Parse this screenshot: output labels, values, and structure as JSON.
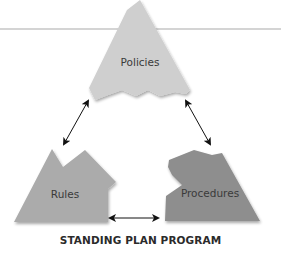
{
  "diagram": {
    "title": "STANDING PLAN PROGRAM",
    "nodes": [
      {
        "id": "policies",
        "label": "Policies",
        "color": "#cfcfcf"
      },
      {
        "id": "rules",
        "label": "Rules",
        "color": "#ababab"
      },
      {
        "id": "procedures",
        "label": "Procedures",
        "color": "#8e8e8e"
      }
    ],
    "edges": [
      {
        "from": "policies",
        "to": "rules",
        "direction": "bidirectional"
      },
      {
        "from": "policies",
        "to": "procedures",
        "direction": "bidirectional"
      },
      {
        "from": "rules",
        "to": "procedures",
        "direction": "bidirectional"
      }
    ]
  }
}
